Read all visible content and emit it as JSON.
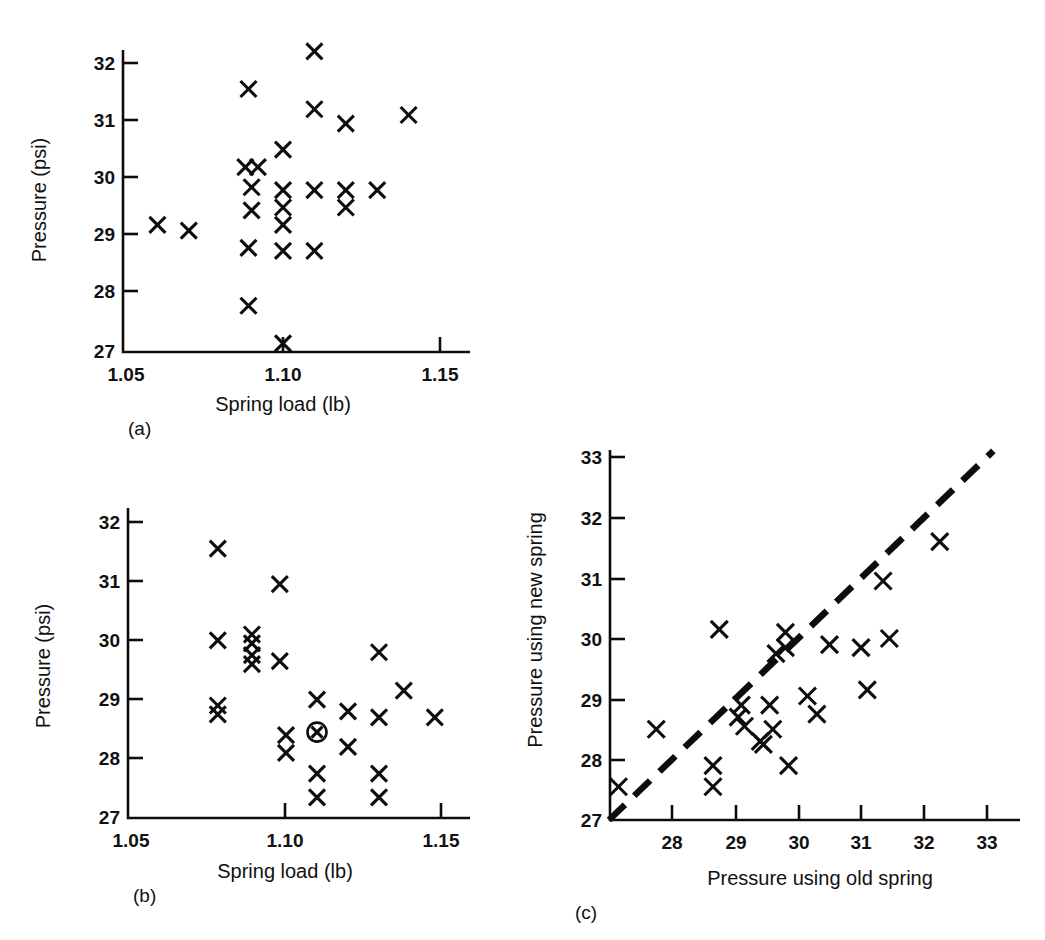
{
  "figure": {
    "background": "#ffffff",
    "marker_color": "#0d0d0d",
    "marker_symbol": "x-cross"
  },
  "panels": {
    "a": {
      "label": "(a)",
      "xlabel": "Spring load (lb)",
      "ylabel": "Pressure (psi)",
      "xticks": [
        "1.05",
        "1.10",
        "1.15"
      ],
      "yticks": [
        "27",
        "28",
        "29",
        "30",
        "31",
        "32"
      ]
    },
    "b": {
      "label": "(b)",
      "xlabel": "Spring load (lb)",
      "ylabel": "Pressure (psi)",
      "xticks": [
        "1.05",
        "1.10",
        "1.15"
      ],
      "yticks": [
        "27",
        "28",
        "29",
        "30",
        "31",
        "32"
      ]
    },
    "c": {
      "label": "(c)",
      "xlabel": "Pressure using old spring",
      "ylabel": "Pressure using new spring",
      "xticks": [
        "28",
        "29",
        "30",
        "31",
        "32",
        "33"
      ],
      "yticks": [
        "27",
        "28",
        "29",
        "30",
        "31",
        "32",
        "33"
      ]
    }
  },
  "chart_data": [
    {
      "id": "panel-a",
      "type": "scatter",
      "title": "(a)",
      "xlabel": "Spring load (lb)",
      "ylabel": "Pressure (psi)",
      "xlim": [
        1.042,
        1.155
      ],
      "ylim": [
        27.0,
        32.45
      ],
      "xticks": [
        1.05,
        1.1,
        1.15
      ],
      "yticks": [
        27,
        28,
        29,
        30,
        31,
        32
      ],
      "grid": false,
      "legend": null,
      "marker": "x",
      "points": [
        {
          "x": 1.06,
          "y": 29.2
        },
        {
          "x": 1.07,
          "y": 29.1
        },
        {
          "x": 1.088,
          "y": 30.2
        },
        {
          "x": 1.092,
          "y": 30.2
        },
        {
          "x": 1.09,
          "y": 29.85
        },
        {
          "x": 1.09,
          "y": 29.45
        },
        {
          "x": 1.089,
          "y": 28.8
        },
        {
          "x": 1.089,
          "y": 31.55
        },
        {
          "x": 1.089,
          "y": 27.8
        },
        {
          "x": 1.1,
          "y": 30.5
        },
        {
          "x": 1.1,
          "y": 29.8
        },
        {
          "x": 1.1,
          "y": 29.5
        },
        {
          "x": 1.1,
          "y": 29.2
        },
        {
          "x": 1.1,
          "y": 28.75
        },
        {
          "x": 1.1,
          "y": 27.15
        },
        {
          "x": 1.11,
          "y": 32.2
        },
        {
          "x": 1.11,
          "y": 31.2
        },
        {
          "x": 1.11,
          "y": 29.8
        },
        {
          "x": 1.11,
          "y": 28.75
        },
        {
          "x": 1.12,
          "y": 30.95
        },
        {
          "x": 1.12,
          "y": 29.8
        },
        {
          "x": 1.12,
          "y": 29.5
        },
        {
          "x": 1.13,
          "y": 29.8
        },
        {
          "x": 1.14,
          "y": 31.1
        }
      ]
    },
    {
      "id": "panel-b",
      "type": "scatter",
      "title": "(b)",
      "xlabel": "Spring load (lb)",
      "ylabel": "Pressure (psi)",
      "xlim": [
        1.042,
        1.155
      ],
      "ylim": [
        27.0,
        32.45
      ],
      "xticks": [
        1.05,
        1.1,
        1.15
      ],
      "yticks": [
        27,
        28,
        29,
        30,
        31,
        32
      ],
      "grid": false,
      "legend": null,
      "marker": "x",
      "highlighted_point": {
        "x": 1.11,
        "y": 28.45,
        "marker": "circled-x"
      },
      "points": [
        {
          "x": 1.078,
          "y": 31.55
        },
        {
          "x": 1.078,
          "y": 30.0
        },
        {
          "x": 1.078,
          "y": 28.9
        },
        {
          "x": 1.078,
          "y": 28.75
        },
        {
          "x": 1.089,
          "y": 30.1
        },
        {
          "x": 1.089,
          "y": 29.95
        },
        {
          "x": 1.089,
          "y": 29.75
        },
        {
          "x": 1.089,
          "y": 29.6
        },
        {
          "x": 1.098,
          "y": 30.95
        },
        {
          "x": 1.098,
          "y": 29.65
        },
        {
          "x": 1.1,
          "y": 28.4
        },
        {
          "x": 1.1,
          "y": 28.1
        },
        {
          "x": 1.11,
          "y": 29.0
        },
        {
          "x": 1.11,
          "y": 27.75
        },
        {
          "x": 1.11,
          "y": 27.35
        },
        {
          "x": 1.12,
          "y": 28.8
        },
        {
          "x": 1.12,
          "y": 28.2
        },
        {
          "x": 1.13,
          "y": 29.8
        },
        {
          "x": 1.13,
          "y": 28.7
        },
        {
          "x": 1.13,
          "y": 27.75
        },
        {
          "x": 1.13,
          "y": 27.35
        },
        {
          "x": 1.138,
          "y": 29.15
        },
        {
          "x": 1.148,
          "y": 28.7
        }
      ]
    },
    {
      "id": "panel-c",
      "type": "scatter",
      "title": "(c)",
      "xlabel": "Pressure using old spring",
      "ylabel": "Pressure using new spring",
      "xlim": [
        27.0,
        33.35
      ],
      "ylim": [
        27.0,
        33.35
      ],
      "xticks": [
        28,
        29,
        30,
        31,
        32,
        33
      ],
      "yticks": [
        27,
        28,
        29,
        30,
        31,
        32,
        33
      ],
      "grid": false,
      "legend": null,
      "marker": "x",
      "reference_line": {
        "type": "dashed",
        "from": [
          27.0,
          27.0
        ],
        "to": [
          33.1,
          33.1
        ],
        "description": "y = x identity line"
      },
      "points": [
        {
          "x": 27.15,
          "y": 27.55
        },
        {
          "x": 27.75,
          "y": 28.5
        },
        {
          "x": 28.75,
          "y": 30.15
        },
        {
          "x": 28.65,
          "y": 27.9
        },
        {
          "x": 28.65,
          "y": 27.55
        },
        {
          "x": 29.1,
          "y": 28.9
        },
        {
          "x": 29.05,
          "y": 28.7
        },
        {
          "x": 29.15,
          "y": 28.55
        },
        {
          "x": 29.4,
          "y": 28.3
        },
        {
          "x": 29.45,
          "y": 28.25
        },
        {
          "x": 29.55,
          "y": 28.9
        },
        {
          "x": 29.6,
          "y": 28.5
        },
        {
          "x": 29.65,
          "y": 29.75
        },
        {
          "x": 29.8,
          "y": 30.1
        },
        {
          "x": 29.8,
          "y": 29.85
        },
        {
          "x": 29.85,
          "y": 27.9
        },
        {
          "x": 30.15,
          "y": 29.05
        },
        {
          "x": 30.3,
          "y": 28.75
        },
        {
          "x": 30.5,
          "y": 29.9
        },
        {
          "x": 31.0,
          "y": 29.85
        },
        {
          "x": 31.1,
          "y": 29.15
        },
        {
          "x": 31.35,
          "y": 30.95
        },
        {
          "x": 31.45,
          "y": 30.0
        },
        {
          "x": 32.25,
          "y": 31.6
        }
      ]
    }
  ]
}
